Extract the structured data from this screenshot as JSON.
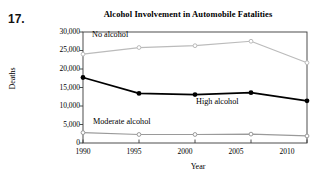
{
  "problem_number": "17.",
  "chart_data": {
    "type": "line",
    "title": "Alcohol Involvement in Automobile Fatalities",
    "xlabel": "Year",
    "ylabel": "Deaths",
    "categories": [
      "1990",
      "1995",
      "2000",
      "2005",
      "2010"
    ],
    "x": [
      1990,
      1995,
      2000,
      2005,
      2010
    ],
    "xlim": [
      1990,
      2010
    ],
    "ylim": [
      0,
      30000
    ],
    "yticks": [
      "0",
      "5,000",
      "10,000",
      "15,000",
      "20,000",
      "25,000",
      "30,000"
    ],
    "ytick_values": [
      0,
      5000,
      10000,
      15000,
      20000,
      25000,
      30000
    ],
    "grid": false,
    "legend": "inline-annotations",
    "series": [
      {
        "name": "No alcohol",
        "values": [
          24000,
          25800,
          26300,
          27500,
          21700
        ],
        "color": "#bbbbbb",
        "marker": "open-circle",
        "label_x": 92,
        "label_y": 37
      },
      {
        "name": "High alcohol",
        "values": [
          17700,
          13400,
          13100,
          13600,
          11400
        ],
        "color": "#000000",
        "marker": "filled-circle",
        "label_x": 196,
        "label_y": 104
      },
      {
        "name": "Moderate alcohol",
        "values": [
          2800,
          2300,
          2300,
          2400,
          1900
        ],
        "color": "#9a9a9a",
        "marker": "open-circle",
        "label_x": 93,
        "label_y": 124
      }
    ],
    "annotations": [
      {
        "text": "No alcohol"
      },
      {
        "text": "High alcohol"
      },
      {
        "text": "Moderate alcohol"
      }
    ]
  }
}
